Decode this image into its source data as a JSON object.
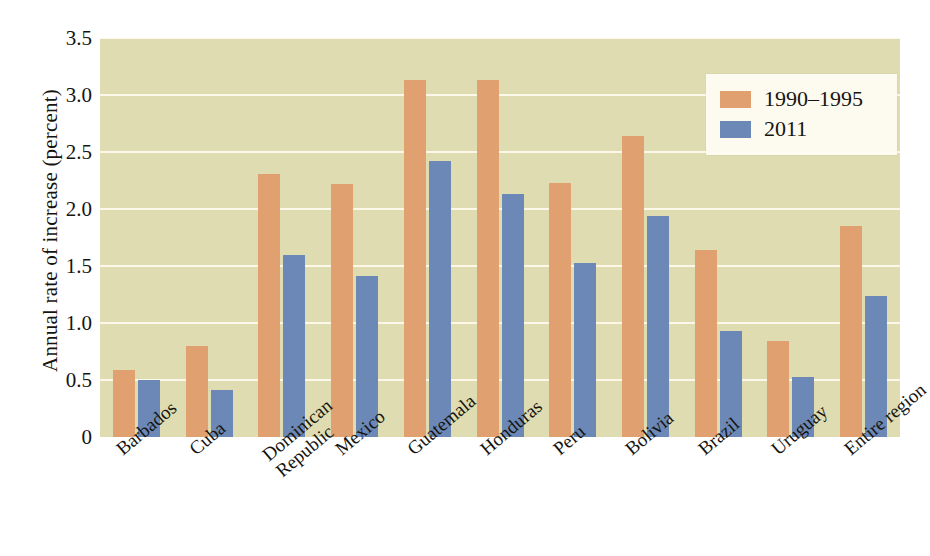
{
  "chart_data": {
    "type": "bar",
    "title": "",
    "xlabel": "",
    "ylabel": "Annual rate of increase (percent)",
    "ylim": [
      0,
      3.5
    ],
    "yticks": [
      "0",
      "0.5",
      "1.0",
      "1.5",
      "2.0",
      "2.5",
      "3.0",
      "3.5"
    ],
    "ytick_values": [
      0,
      0.5,
      1.0,
      1.5,
      2.0,
      2.5,
      3.0,
      3.5
    ],
    "grid": "horizontal",
    "legend_position": "top-right",
    "categories": [
      "Barbados",
      "Cuba",
      "Dominican\nRepublic",
      "Mexico",
      "Guatemala",
      "Honduras",
      "Peru",
      "Bolivia",
      "Brazil",
      "Uruguay",
      "Entire region"
    ],
    "series": [
      {
        "name": "1990–1995",
        "color": "#e0a070",
        "values": [
          0.59,
          0.8,
          2.31,
          2.22,
          3.13,
          3.13,
          2.23,
          2.64,
          1.64,
          0.84,
          1.85
        ]
      },
      {
        "name": "2011",
        "color": "#6b88b6",
        "values": [
          0.5,
          0.41,
          1.6,
          1.41,
          2.42,
          2.13,
          1.53,
          1.94,
          0.93,
          0.53,
          1.24
        ]
      }
    ],
    "plot_background": "#dedcb0",
    "gridline_color": "#fbf8ea"
  }
}
